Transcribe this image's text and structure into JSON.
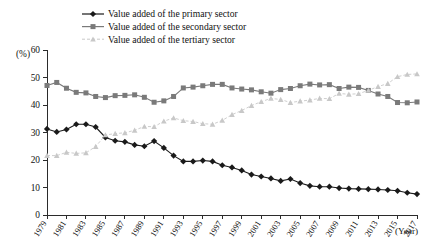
{
  "chart_data": {
    "type": "line",
    "title": "",
    "xlabel": "(Year)",
    "ylabel": "(%)",
    "ylim": [
      0,
      60
    ],
    "ytick_step": 10,
    "yticks": [
      0,
      10,
      20,
      30,
      40,
      50,
      60
    ],
    "xlim": [
      1979,
      2017
    ],
    "grid": false,
    "legend_position": "top-center",
    "x": [
      1979,
      1980,
      1981,
      1982,
      1983,
      1984,
      1985,
      1986,
      1987,
      1988,
      1989,
      1990,
      1991,
      1992,
      1993,
      1994,
      1995,
      1996,
      1997,
      1998,
      1999,
      2000,
      2001,
      2002,
      2003,
      2004,
      2005,
      2006,
      2007,
      2008,
      2009,
      2010,
      2011,
      2012,
      2013,
      2014,
      2015,
      2016,
      2017
    ],
    "xtick_labels": [
      "1979",
      "1981",
      "1983",
      "1985",
      "1987",
      "1989",
      "1991",
      "1993",
      "1995",
      "1997",
      "1999",
      "2001",
      "2003",
      "2005",
      "2007",
      "2009",
      "2011",
      "2013",
      "2015",
      "2017"
    ],
    "series": [
      {
        "name": "Value added of the primary sector",
        "marker": "diamond",
        "color": "#1a1a1a",
        "values": [
          31.3,
          30.2,
          31.1,
          33.0,
          33.0,
          32.0,
          28.2,
          27.0,
          26.6,
          25.5,
          25.0,
          26.9,
          24.4,
          21.6,
          19.5,
          19.5,
          19.8,
          19.5,
          18.1,
          17.3,
          16.2,
          14.7,
          14.0,
          13.3,
          12.4,
          13.1,
          11.6,
          10.6,
          10.3,
          10.3,
          9.8,
          9.6,
          9.5,
          9.4,
          9.3,
          9.1,
          8.8,
          8.1,
          7.6
        ]
      },
      {
        "name": "Value added of the secondary sector",
        "marker": "square",
        "color": "#7a7a7a",
        "values": [
          47.1,
          48.2,
          46.1,
          44.6,
          44.4,
          43.1,
          42.7,
          43.4,
          43.5,
          43.7,
          42.8,
          41.0,
          41.5,
          43.1,
          46.2,
          46.5,
          47.0,
          47.5,
          47.5,
          46.2,
          45.8,
          45.5,
          44.8,
          44.3,
          45.6,
          46.0,
          47.0,
          47.6,
          47.3,
          47.4,
          46.0,
          46.5,
          46.4,
          45.3,
          44.0,
          43.1,
          40.9,
          40.8,
          41.1
        ]
      },
      {
        "name": "Value added of the tertiary sector",
        "marker": "triangle",
        "color": "#c8c8c8",
        "values": [
          21.6,
          21.6,
          22.8,
          22.4,
          22.6,
          24.9,
          29.1,
          29.6,
          29.9,
          30.8,
          32.2,
          32.1,
          34.1,
          35.3,
          34.3,
          34.0,
          33.2,
          33.0,
          34.4,
          36.5,
          38.0,
          39.8,
          41.2,
          42.4,
          42.0,
          40.9,
          41.4,
          41.8,
          42.4,
          42.3,
          44.2,
          43.9,
          44.1,
          45.3,
          46.7,
          47.8,
          50.3,
          51.1,
          51.3
        ]
      }
    ]
  },
  "legend": {
    "items": [
      {
        "label": "Value added of the primary sector"
      },
      {
        "label": "Value added of the secondary sector"
      },
      {
        "label": "Value added of the tertiary sector"
      }
    ]
  },
  "axes": {
    "y_unit": "(%)",
    "x_unit": "(Year)"
  }
}
